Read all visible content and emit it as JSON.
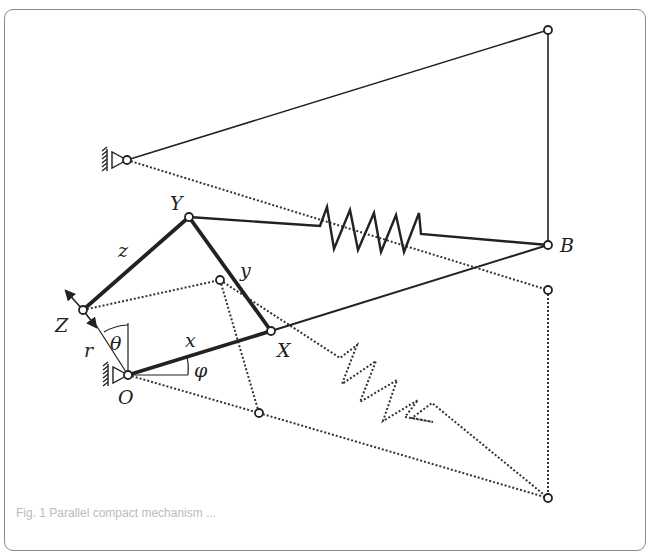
{
  "figure": {
    "labels": {
      "Y": "Y",
      "B": "B",
      "Z": "Z",
      "X": "X",
      "O": "O",
      "z": "z",
      "y": "y",
      "x": "x",
      "r": "r",
      "theta": "θ",
      "phi": "φ"
    },
    "nodes": {
      "top_right": [
        548,
        30
      ],
      "upper_ground": [
        127,
        160
      ],
      "B": [
        548,
        245
      ],
      "Y": [
        189,
        217
      ],
      "Z": [
        83,
        310
      ],
      "X": [
        271,
        331
      ],
      "O": [
        128,
        375
      ],
      "dotted_upper": [
        220,
        280
      ],
      "dotted_right": [
        548,
        290
      ],
      "dotted_lower": [
        259,
        413
      ],
      "bottom_right": [
        548,
        498
      ]
    },
    "colors": {
      "line": "#222222",
      "frame": "#8a8a8a"
    }
  },
  "caption": "Fig. 1  Parallel compact mechanism ..."
}
